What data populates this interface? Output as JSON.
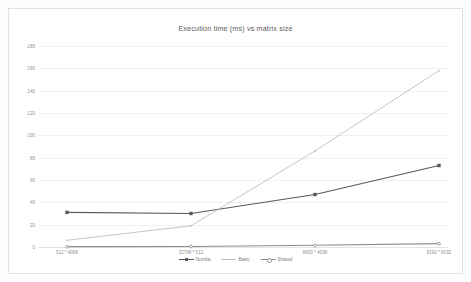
{
  "chart_data": {
    "type": "line",
    "title": "Execution time (ms) vs matrix size",
    "xlabel": "",
    "ylabel": "",
    "categories": [
      "512 * 4096",
      "32768 * 512",
      "8600 * 4096",
      "8192 * 8192"
    ],
    "ylim": [
      0,
      180
    ],
    "yticks": [
      180,
      160,
      140,
      120,
      100,
      80,
      60,
      40,
      20,
      0
    ],
    "grid": true,
    "legend_position": "bottom",
    "series": [
      {
        "name": "Numba",
        "color": "#595959",
        "marker": "square",
        "values": [
          31,
          30,
          47,
          73
        ]
      },
      {
        "name": "Basic",
        "color": "#bfbfbf",
        "marker": "none",
        "values": [
          6,
          19,
          86,
          158
        ]
      },
      {
        "name": "Shared",
        "color": "#8c8c8c",
        "marker": "circle",
        "values": [
          0.3,
          0.5,
          1.5,
          3
        ]
      }
    ]
  }
}
